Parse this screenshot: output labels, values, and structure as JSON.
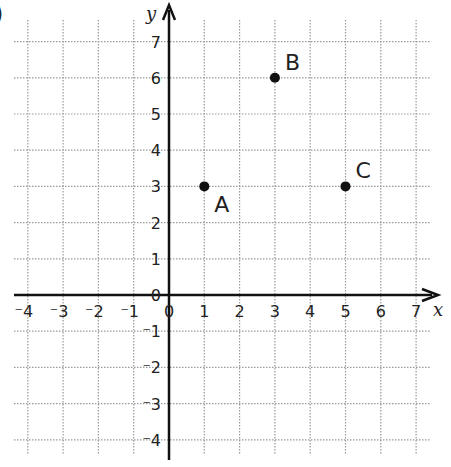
{
  "corner_mark": ")",
  "chart_data": {
    "type": "scatter",
    "title": "",
    "xlabel": "x",
    "ylabel": "y",
    "xlim": [
      -4,
      7
    ],
    "ylim": [
      -4,
      7
    ],
    "grid": true,
    "grid_style": "dotted",
    "x_ticks": [
      "-4",
      "-3",
      "-2",
      "-1",
      "0",
      "1",
      "2",
      "3",
      "4",
      "5",
      "6",
      "7"
    ],
    "y_ticks": [
      "-4",
      "-3",
      "-2",
      "-1",
      "0",
      "1",
      "2",
      "3",
      "4",
      "5",
      "6",
      "7"
    ],
    "origin_label": "0",
    "points": [
      {
        "label": "A",
        "x": 1,
        "y": 3
      },
      {
        "label": "B",
        "x": 3,
        "y": 6
      },
      {
        "label": "C",
        "x": 5,
        "y": 3
      }
    ],
    "colors": {
      "axis": "#111111",
      "grid": "#9a9a9a",
      "point": "#111111",
      "text": "#222222"
    }
  }
}
